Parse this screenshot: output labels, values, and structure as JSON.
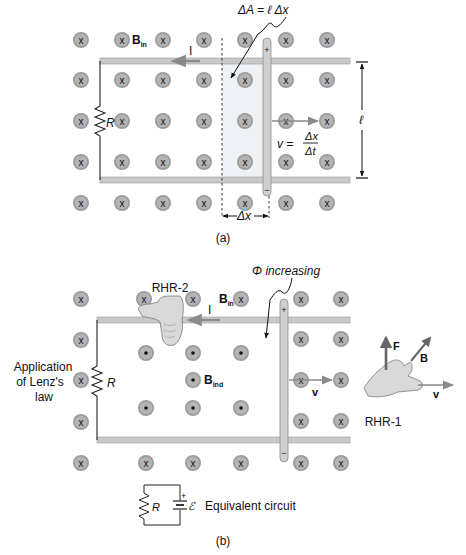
{
  "panel_a": {
    "caption": "(a)",
    "labels": {
      "b_field": "B",
      "b_field_sub": "in",
      "current": "I",
      "resistor": "R",
      "delta_area": "ΔA = ℓ Δx",
      "velocity_lhs": "v =",
      "velocity_num": "Δx",
      "velocity_den": "Δt",
      "length": "ℓ",
      "delta_x": "Δx",
      "rod_plus": "+",
      "rod_minus": "−"
    }
  },
  "panel_b": {
    "caption": "(b)",
    "labels": {
      "rhr2": "RHR-2",
      "b_field": "B",
      "b_field_sub": "in",
      "current": "I",
      "flux": "Φ increasing",
      "lenz_line1": "Application",
      "lenz_line2": "of Lenz's",
      "lenz_line3": "law",
      "resistor": "R",
      "b_induced": "B",
      "b_induced_sub": "ind",
      "velocity": "v",
      "force": "F",
      "rhr1_b": "B",
      "rhr1_v": "v",
      "rhr1": "RHR-1",
      "rod_plus": "+",
      "rod_minus": "−"
    },
    "equivalent_circuit": {
      "resistor": "R",
      "emf": "ℰ",
      "battery_plus": "+",
      "label": "Equivalent circuit"
    }
  },
  "colors": {
    "rail": "#c9c9c9",
    "rail_edge": "#9a9a9a",
    "field_circle": "#9c9c9c",
    "shaded_area": "#eef1f6",
    "text": "#111111",
    "arrow_gray": "#8a8a8a"
  }
}
